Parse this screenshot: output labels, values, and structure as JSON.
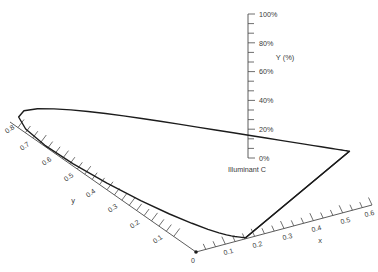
{
  "chart_data": {
    "type": "line",
    "title": "",
    "subtitle": "",
    "axes": {
      "x": {
        "label": "x",
        "ticks": [
          "0",
          "0.1",
          "0.2",
          "0.3",
          "0.4",
          "0.5",
          "0.6"
        ],
        "values": [
          0,
          0.1,
          0.2,
          0.3,
          0.4,
          0.5,
          0.6
        ],
        "range": [
          0,
          0.6
        ],
        "minor_ticks_per_interval": 2,
        "grid": false
      },
      "y": {
        "label": "y",
        "ticks": [
          "0",
          "0.1",
          "0.2",
          "0.3",
          "0.4",
          "0.5",
          "0.6",
          "0.7",
          "0.8"
        ],
        "values": [
          0,
          0.1,
          0.2,
          0.3,
          0.4,
          0.5,
          0.6,
          0.7,
          0.8
        ],
        "range": [
          0,
          0.8
        ],
        "minor_ticks_per_interval": 2,
        "grid": false
      },
      "Y": {
        "label": "Y (%)",
        "ticks": [
          "0%",
          "20%",
          "40%",
          "60%",
          "80%",
          "100%"
        ],
        "values": [
          0,
          20,
          40,
          60,
          80,
          100
        ],
        "range": [
          0,
          100
        ],
        "minor_ticks_per_interval": 2,
        "grid": false
      }
    },
    "annotations": [
      {
        "name": "illuminant-c",
        "text": "Illuminant C",
        "x": 0.31,
        "y": 0.316,
        "Y": 0
      }
    ],
    "series": [
      {
        "name": "spectral-locus",
        "closed": true,
        "points_xy": [
          [
            0.174,
            0.005
          ],
          [
            0.1736,
            0.0049
          ],
          [
            0.1733,
            0.0048
          ],
          [
            0.173,
            0.0048
          ],
          [
            0.1726,
            0.0048
          ],
          [
            0.1721,
            0.0048
          ],
          [
            0.1714,
            0.0051
          ],
          [
            0.1703,
            0.0058
          ],
          [
            0.1689,
            0.0069
          ],
          [
            0.1669,
            0.0086
          ],
          [
            0.1644,
            0.0109
          ],
          [
            0.1611,
            0.0138
          ],
          [
            0.1566,
            0.0177
          ],
          [
            0.151,
            0.0227
          ],
          [
            0.144,
            0.0297
          ],
          [
            0.1355,
            0.0399
          ],
          [
            0.1241,
            0.0578
          ],
          [
            0.1096,
            0.0868
          ],
          [
            0.0913,
            0.1327
          ],
          [
            0.0687,
            0.2007
          ],
          [
            0.0454,
            0.295
          ],
          [
            0.0235,
            0.4127
          ],
          [
            0.0082,
            0.5384
          ],
          [
            0.0039,
            0.6548
          ],
          [
            0.0139,
            0.7502
          ],
          [
            0.0389,
            0.812
          ],
          [
            0.0743,
            0.8338
          ],
          [
            0.1142,
            0.8262
          ],
          [
            0.1547,
            0.8059
          ],
          [
            0.1929,
            0.7816
          ],
          [
            0.2296,
            0.7543
          ],
          [
            0.2658,
            0.7243
          ],
          [
            0.3016,
            0.6923
          ],
          [
            0.3373,
            0.6589
          ],
          [
            0.3731,
            0.6245
          ],
          [
            0.4087,
            0.5896
          ],
          [
            0.4441,
            0.5547
          ],
          [
            0.4788,
            0.5202
          ],
          [
            0.5125,
            0.4866
          ],
          [
            0.5448,
            0.4544
          ],
          [
            0.5752,
            0.4242
          ],
          [
            0.6029,
            0.3965
          ],
          [
            0.627,
            0.3725
          ],
          [
            0.6482,
            0.3514
          ],
          [
            0.6658,
            0.334
          ],
          [
            0.6801,
            0.3197
          ],
          [
            0.6915,
            0.3083
          ],
          [
            0.7006,
            0.2993
          ],
          [
            0.7079,
            0.292
          ],
          [
            0.714,
            0.2859
          ],
          [
            0.719,
            0.2809
          ],
          [
            0.723,
            0.277
          ],
          [
            0.726,
            0.274
          ],
          [
            0.7283,
            0.2717
          ],
          [
            0.73,
            0.27
          ],
          [
            0.7311,
            0.2689
          ],
          [
            0.732,
            0.268
          ],
          [
            0.7327,
            0.2673
          ],
          [
            0.7334,
            0.2666
          ],
          [
            0.734,
            0.266
          ]
        ],
        "purple_line": [
          [
            0.734,
            0.266
          ],
          [
            0.174,
            0.005
          ]
        ]
      }
    ],
    "legend": {
      "entries": [],
      "position": "none"
    }
  },
  "figure": {
    "background_color": "#ffffff",
    "line_color": "#1c1c1c",
    "axis_color": "#4a4a4a",
    "text_color": "#3a3a3a"
  },
  "labels": {
    "x_axis_title": "x",
    "y_axis_title": "y",
    "Y_axis_title": "Y (%)",
    "illuminant": "Illuminant C",
    "origin": "0",
    "x_ticks": [
      "0.1",
      "0.2",
      "0.3",
      "0.4",
      "0.5",
      "0.6"
    ],
    "y_ticks": [
      "0.1",
      "0.2",
      "0.3",
      "0.4",
      "0.5",
      "0.6",
      "0.7",
      "0.8"
    ],
    "Y_ticks": [
      "0%",
      "20%",
      "40%",
      "60%",
      "80%",
      "100%"
    ]
  }
}
